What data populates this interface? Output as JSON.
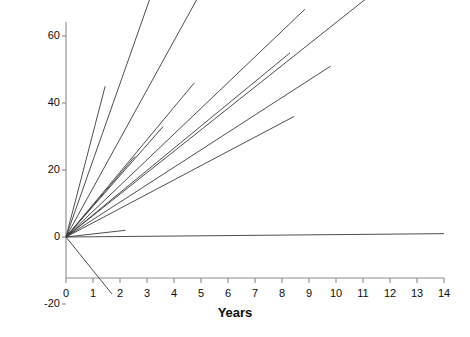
{
  "chart_data": {
    "type": "line",
    "title": "",
    "xlabel": "Years",
    "ylabel": "IQ 'catch up'",
    "xlim": [
      0,
      14
    ],
    "ylim": [
      -20,
      90
    ],
    "grid": false,
    "legend": "none",
    "xticks": [
      0,
      1,
      2,
      3,
      4,
      5,
      6,
      7,
      8,
      9,
      10,
      11,
      12,
      13,
      14
    ],
    "xtick_labels": [
      "0",
      "1",
      "2",
      "3",
      "4",
      "5",
      "6",
      "7",
      "8",
      "9",
      "10",
      "11",
      "12",
      "13",
      "14"
    ],
    "yticks": [
      -20,
      0,
      20,
      40,
      60,
      80,
      90
    ],
    "ytick_labels": [
      "-20",
      "0",
      "20",
      "40",
      "60",
      "80",
      "90"
    ],
    "series": [
      {
        "name": "case-1",
        "x": [
          0,
          1.45
        ],
        "y": [
          0,
          45
        ]
      },
      {
        "name": "case-2",
        "x": [
          0,
          3.45
        ],
        "y": [
          0,
          79
        ]
      },
      {
        "name": "case-3",
        "x": [
          0,
          4.85
        ],
        "y": [
          0,
          71
        ]
      },
      {
        "name": "case-4",
        "x": [
          0,
          4.75
        ],
        "y": [
          0,
          46
        ]
      },
      {
        "name": "case-5",
        "x": [
          0,
          3.6
        ],
        "y": [
          0,
          33
        ]
      },
      {
        "name": "case-6",
        "x": [
          0,
          2.55
        ],
        "y": [
          0,
          24
        ]
      },
      {
        "name": "case-7",
        "x": [
          0,
          8.85
        ],
        "y": [
          0,
          68
        ]
      },
      {
        "name": "case-8",
        "x": [
          0,
          8.3
        ],
        "y": [
          0,
          55
        ]
      },
      {
        "name": "case-9",
        "x": [
          0,
          9.8
        ],
        "y": [
          0,
          51
        ]
      },
      {
        "name": "case-10",
        "x": [
          0,
          8.45
        ],
        "y": [
          0,
          36
        ]
      },
      {
        "name": "case-11",
        "x": [
          0,
          12.5
        ],
        "y": [
          0,
          80
        ]
      },
      {
        "name": "case-12",
        "x": [
          0,
          14.0
        ],
        "y": [
          0,
          1
        ]
      },
      {
        "name": "case-13",
        "x": [
          0,
          2.2
        ],
        "y": [
          0,
          2
        ]
      },
      {
        "name": "case-14",
        "x": [
          0,
          1.7
        ],
        "y": [
          0,
          -17
        ]
      }
    ],
    "line_color": "#3a3a3a",
    "axis_color": "#8a8a8a"
  }
}
